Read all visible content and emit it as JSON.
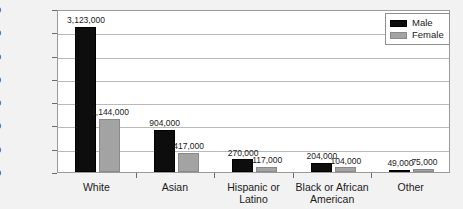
{
  "chart_data": {
    "type": "bar",
    "title": "",
    "subtitle": "",
    "xlabel": "",
    "ylabel": "",
    "grid": true,
    "legend_position": "top-right",
    "categories": [
      "White",
      "Asian",
      "Hispanic or Latino",
      "Black or African American",
      "Other"
    ],
    "category_lines": [
      [
        "White"
      ],
      [
        "Asian"
      ],
      [
        "Hispanic or",
        "Latino"
      ],
      [
        "Black or African",
        "American"
      ],
      [
        "Other"
      ]
    ],
    "series": [
      {
        "name": "Male",
        "color": "#0d0d0d",
        "values": [
          3123000,
          904000,
          270000,
          204000,
          49000
        ],
        "labels": [
          "3,123,000",
          "904,000",
          "270,000",
          "204,000",
          "49,000"
        ]
      },
      {
        "name": "Female",
        "color": "#a3a3a3",
        "values": [
          1144000,
          417000,
          117000,
          104000,
          75000
        ],
        "labels": [
          "1,144,000",
          "417,000",
          "117,000",
          "104,000",
          "75,000"
        ]
      }
    ],
    "ylim": [
      0,
      3500000
    ],
    "yticks": [
      0,
      500000,
      1000000,
      1500000,
      2000000,
      2500000,
      3000000,
      3500000
    ],
    "ytick_labels": [
      "0",
      "500,000",
      "1,000,000",
      "1,500,000",
      "2,000,000",
      "2,500,000",
      "3,000,000",
      "3,500,000"
    ]
  },
  "legend": {
    "items": [
      {
        "label": "Male",
        "color": "#0d0d0d"
      },
      {
        "label": "Female",
        "color": "#a3a3a3"
      }
    ]
  },
  "colors": {
    "background": "#f2f2f2",
    "plot_background": "#ffffff",
    "gridline": "#b9b9b9",
    "axis": "#6b6b6b",
    "text": "#1a1a1a",
    "male": "#0d0d0d",
    "female": "#a3a3a3"
  }
}
